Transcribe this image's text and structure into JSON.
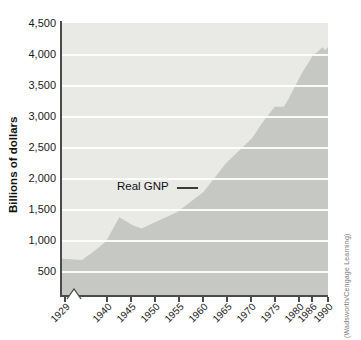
{
  "figure": {
    "y_axis_title": "Billions of dollars",
    "series_label": "Real GNP",
    "credit": "(Wadsworth/Cengage Learning)",
    "y_tick_labels": [
      "4,500",
      "4,000",
      "3,500",
      "3,000",
      "2,500",
      "2,000",
      "1,500",
      "1,000",
      "500"
    ],
    "x_tick_labels": [
      "1929",
      "1940",
      "1945",
      "1950",
      "1955",
      "1960",
      "1965",
      "1970",
      "1975",
      "1980",
      "1986",
      "1990"
    ]
  },
  "chart_data": {
    "type": "area",
    "title": "",
    "xlabel": "",
    "ylabel": "Billions of dollars",
    "legend": "none (inline label with leader line pointing at curve)",
    "grid": "horizontal white gridlines at every 500",
    "ylim": [
      0,
      4500
    ],
    "xlim": [
      1929,
      1990
    ],
    "y_ticks": [
      500,
      1000,
      1500,
      2000,
      2500,
      3000,
      3500,
      4000,
      4500
    ],
    "x_tick_labels": [
      "1929",
      "1940",
      "1945",
      "1950",
      "1955",
      "1960",
      "1965",
      "1970",
      "1975",
      "1980",
      "1986",
      "1990"
    ],
    "x_axis_break_between": [
      "1929",
      "1940"
    ],
    "series": [
      {
        "name": "Real GNP",
        "units": "billions of dollars",
        "points": [
          [
            1929,
            700
          ],
          [
            1934,
            680
          ],
          [
            1937,
            820
          ],
          [
            1940,
            980
          ],
          [
            1943,
            1370
          ],
          [
            1946,
            1240
          ],
          [
            1948,
            1190
          ],
          [
            1952,
            1320
          ],
          [
            1956,
            1450
          ],
          [
            1962,
            1780
          ],
          [
            1967,
            2240
          ],
          [
            1973,
            2650
          ],
          [
            1975,
            2870
          ],
          [
            1978,
            3150
          ],
          [
            1980,
            3150
          ],
          [
            1981,
            3260
          ],
          [
            1984,
            3680
          ],
          [
            1986.5,
            3970
          ],
          [
            1988.8,
            4110
          ],
          [
            1989.3,
            4060
          ],
          [
            1990,
            4110
          ]
        ]
      }
    ]
  },
  "colors": {
    "plot_background": "#e9eae6",
    "area_fill": "#c6c8c3",
    "gridline": "#ffffff",
    "axis": "#4b4b4b",
    "text": "#1a1a1a",
    "credit_text": "#7a7a7a"
  }
}
